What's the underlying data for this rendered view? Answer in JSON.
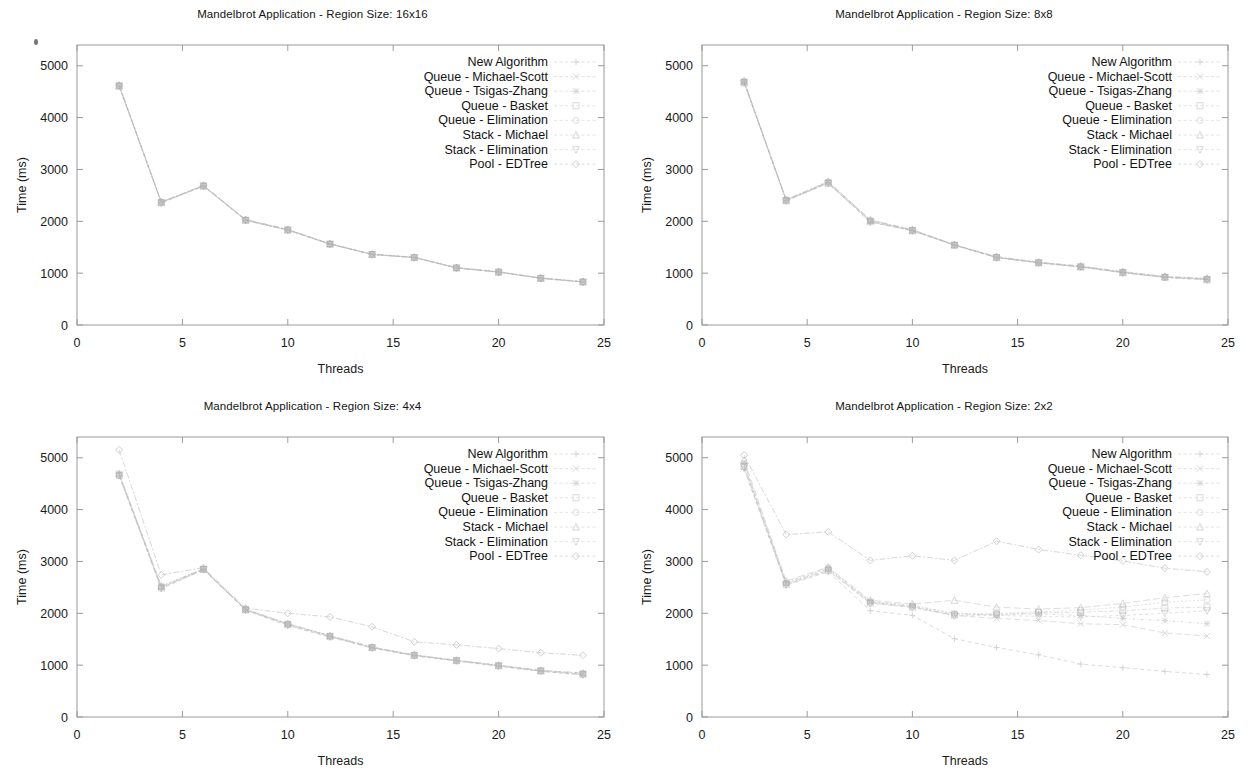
{
  "figure": {
    "axis_x_label": "Threads",
    "axis_y_label": "Time (ms)",
    "x_ticks": [
      "0",
      "5",
      "10",
      "15",
      "20",
      "25"
    ],
    "y_ticks": [
      "0",
      "1000",
      "2000",
      "3000",
      "4000",
      "5000"
    ],
    "series_names": [
      "New Algorithm",
      "Queue - Michael-Scott",
      "Queue - Tsigas-Zhang",
      "Queue - Basket",
      "Queue - Elimination",
      "Stack - Michael",
      "Stack - Elimination",
      "Pool - EDTree"
    ],
    "line_color": "#b9b9b9",
    "frame_color": "#9a9a9a",
    "text_color": "#1a1a1a"
  },
  "panels": [
    {
      "id": "panel-16x16",
      "title": "Mandelbrot Application - Region Size: 16x16"
    },
    {
      "id": "panel-8x8",
      "title": "Mandelbrot Application - Region Size: 8x8"
    },
    {
      "id": "panel-4x4",
      "title": "Mandelbrot Application - Region Size: 4x4"
    },
    {
      "id": "panel-2x2",
      "title": "Mandelbrot Application - Region Size: 2x2"
    }
  ],
  "chart_data": [
    {
      "type": "line",
      "title": "Mandelbrot Application - Region Size: 16x16",
      "xlabel": "Threads",
      "ylabel": "Time (ms)",
      "xlim": [
        0,
        25
      ],
      "ylim": [
        0,
        5400
      ],
      "grid": false,
      "legend_position": "top-right",
      "x": [
        2,
        4,
        6,
        8,
        10,
        12,
        14,
        16,
        18,
        20,
        22,
        24
      ],
      "series": [
        {
          "name": "New Algorithm",
          "values": [
            4610,
            2360,
            2680,
            2020,
            1830,
            1560,
            1360,
            1300,
            1100,
            1020,
            900,
            830
          ]
        },
        {
          "name": "Queue - Michael-Scott",
          "values": [
            4620,
            2370,
            2690,
            2030,
            1840,
            1565,
            1365,
            1305,
            1105,
            1025,
            905,
            835
          ]
        },
        {
          "name": "Queue - Tsigas-Zhang",
          "values": [
            4615,
            2365,
            2685,
            2025,
            1835,
            1560,
            1362,
            1302,
            1102,
            1022,
            902,
            832
          ]
        },
        {
          "name": "Queue - Basket",
          "values": [
            4605,
            2355,
            2675,
            2015,
            1828,
            1558,
            1358,
            1298,
            1098,
            1018,
            898,
            828
          ]
        },
        {
          "name": "Queue - Elimination",
          "values": [
            4612,
            2362,
            2682,
            2022,
            1832,
            1561,
            1361,
            1301,
            1101,
            1021,
            901,
            831
          ]
        },
        {
          "name": "Stack - Michael",
          "values": [
            4618,
            2368,
            2688,
            2028,
            1838,
            1564,
            1364,
            1304,
            1104,
            1024,
            904,
            834
          ]
        },
        {
          "name": "Stack - Elimination",
          "values": [
            4608,
            2358,
            2678,
            2018,
            1830,
            1559,
            1359,
            1299,
            1099,
            1019,
            899,
            829
          ]
        },
        {
          "name": "Pool - EDTree",
          "values": [
            4625,
            2375,
            2695,
            2035,
            1845,
            1568,
            1368,
            1308,
            1108,
            1028,
            908,
            838
          ]
        }
      ]
    },
    {
      "type": "line",
      "title": "Mandelbrot Application - Region Size: 8x8",
      "xlabel": "Threads",
      "ylabel": "Time (ms)",
      "xlim": [
        0,
        25
      ],
      "ylim": [
        0,
        5400
      ],
      "grid": false,
      "legend_position": "top-right",
      "x": [
        2,
        4,
        6,
        8,
        10,
        12,
        14,
        16,
        18,
        20,
        22,
        24
      ],
      "series": [
        {
          "name": "New Algorithm",
          "values": [
            4680,
            2400,
            2740,
            1980,
            1820,
            1540,
            1300,
            1200,
            1120,
            1010,
            920,
            880
          ]
        },
        {
          "name": "Queue - Michael-Scott",
          "values": [
            4700,
            2410,
            2760,
            2020,
            1830,
            1545,
            1310,
            1205,
            1130,
            1020,
            930,
            890
          ]
        },
        {
          "name": "Queue - Tsigas-Zhang",
          "values": [
            4690,
            2405,
            2750,
            2000,
            1825,
            1542,
            1305,
            1202,
            1125,
            1015,
            925,
            885
          ]
        },
        {
          "name": "Queue - Basket",
          "values": [
            4670,
            2395,
            2730,
            1990,
            1815,
            1538,
            1298,
            1198,
            1115,
            1005,
            915,
            870
          ]
        },
        {
          "name": "Queue - Elimination",
          "values": [
            4685,
            2402,
            2745,
            2005,
            1822,
            1541,
            1302,
            1201,
            1122,
            1012,
            922,
            878
          ]
        },
        {
          "name": "Stack - Michael",
          "values": [
            4695,
            2408,
            2755,
            2015,
            1828,
            1544,
            1308,
            1204,
            1128,
            1018,
            928,
            888
          ]
        },
        {
          "name": "Stack - Elimination",
          "values": [
            4675,
            2398,
            2735,
            1995,
            1818,
            1539,
            1300,
            1199,
            1118,
            1008,
            918,
            872
          ]
        },
        {
          "name": "Pool - EDTree",
          "values": [
            4710,
            2420,
            2770,
            2030,
            1840,
            1550,
            1320,
            1215,
            1140,
            1030,
            940,
            900
          ]
        }
      ]
    },
    {
      "type": "line",
      "title": "Mandelbrot Application - Region Size: 4x4",
      "xlabel": "Threads",
      "ylabel": "Time (ms)",
      "xlim": [
        0,
        25
      ],
      "ylim": [
        0,
        5400
      ],
      "grid": false,
      "legend_position": "top-right",
      "x": [
        2,
        4,
        6,
        8,
        10,
        12,
        14,
        16,
        18,
        20,
        22,
        24
      ],
      "series": [
        {
          "name": "New Algorithm",
          "values": [
            4650,
            2470,
            2840,
            2060,
            1760,
            1540,
            1330,
            1180,
            1080,
            980,
            880,
            810
          ]
        },
        {
          "name": "Queue - Michael-Scott",
          "values": [
            4680,
            2500,
            2850,
            2070,
            1790,
            1560,
            1340,
            1190,
            1090,
            990,
            890,
            830
          ]
        },
        {
          "name": "Queue - Tsigas-Zhang",
          "values": [
            4700,
            2530,
            2860,
            2080,
            1800,
            1570,
            1350,
            1200,
            1095,
            1000,
            900,
            850
          ]
        },
        {
          "name": "Queue - Basket",
          "values": [
            4660,
            2490,
            2845,
            2065,
            1780,
            1550,
            1335,
            1185,
            1085,
            985,
            885,
            820
          ]
        },
        {
          "name": "Queue - Elimination",
          "values": [
            4670,
            2510,
            2855,
            2075,
            1795,
            1565,
            1345,
            1195,
            1092,
            995,
            895,
            840
          ]
        },
        {
          "name": "Stack - Michael",
          "values": [
            4690,
            2520,
            2858,
            2078,
            1798,
            1568,
            1348,
            1198,
            1094,
            998,
            898,
            845
          ]
        },
        {
          "name": "Stack - Elimination",
          "values": [
            4655,
            2480,
            2842,
            2062,
            1770,
            1545,
            1332,
            1182,
            1082,
            982,
            882,
            815
          ]
        },
        {
          "name": "Pool - EDTree",
          "values": [
            5150,
            2740,
            2880,
            2100,
            2000,
            1930,
            1740,
            1450,
            1390,
            1320,
            1240,
            1190
          ]
        }
      ]
    },
    {
      "type": "line",
      "title": "Mandelbrot Application - Region Size: 2x2",
      "xlabel": "Threads",
      "ylabel": "Time (ms)",
      "xlim": [
        0,
        25
      ],
      "ylim": [
        0,
        5400
      ],
      "grid": false,
      "legend_position": "top-right",
      "x": [
        2,
        4,
        6,
        8,
        10,
        12,
        14,
        16,
        18,
        20,
        22,
        24
      ],
      "series": [
        {
          "name": "New Algorithm",
          "values": [
            4780,
            2540,
            2800,
            2050,
            1960,
            1510,
            1340,
            1200,
            1020,
            950,
            880,
            820
          ]
        },
        {
          "name": "Queue - Michael-Scott",
          "values": [
            4850,
            2570,
            2850,
            2210,
            2130,
            1960,
            1900,
            1860,
            1800,
            1780,
            1620,
            1560
          ]
        },
        {
          "name": "Queue - Tsigas-Zhang",
          "values": [
            4900,
            2600,
            2880,
            2230,
            2150,
            2000,
            1970,
            1990,
            1960,
            1900,
            1860,
            1800
          ]
        },
        {
          "name": "Queue - Basket",
          "values": [
            4830,
            2560,
            2830,
            2200,
            2120,
            1970,
            1980,
            2010,
            2020,
            2050,
            2100,
            2120
          ]
        },
        {
          "name": "Queue - Elimination",
          "values": [
            4870,
            2580,
            2860,
            2220,
            2140,
            1990,
            2000,
            2030,
            2060,
            2120,
            2210,
            2260
          ]
        },
        {
          "name": "Stack - Michael",
          "values": [
            4950,
            2620,
            2890,
            2250,
            2180,
            2250,
            2120,
            2080,
            2110,
            2190,
            2300,
            2380
          ]
        },
        {
          "name": "Stack - Elimination",
          "values": [
            4810,
            2550,
            2820,
            2190,
            2110,
            1950,
            1960,
            1940,
            1930,
            1960,
            2000,
            2050
          ]
        },
        {
          "name": "Pool - EDTree",
          "values": [
            5050,
            3520,
            3570,
            3020,
            3110,
            3020,
            3390,
            3230,
            3120,
            3010,
            2870,
            2800
          ]
        }
      ]
    }
  ]
}
